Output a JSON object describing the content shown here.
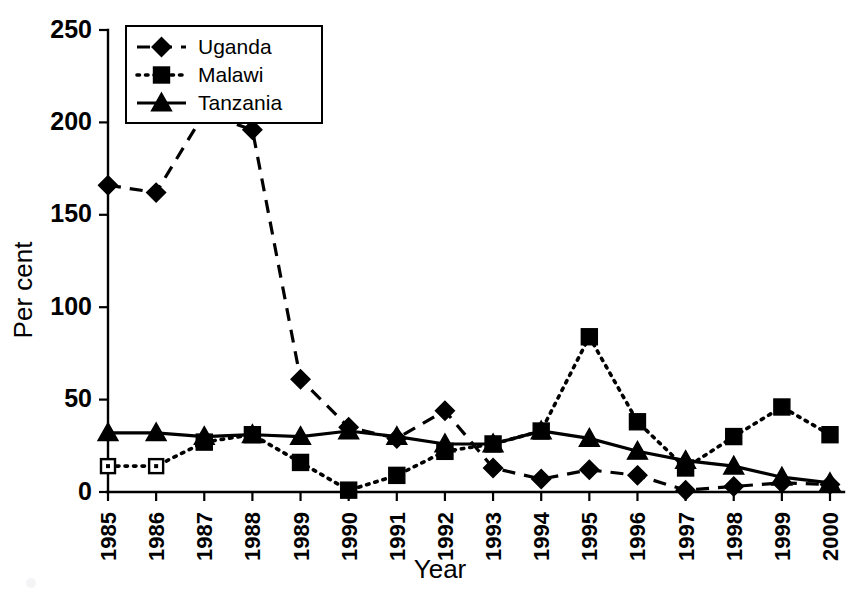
{
  "chart_data": {
    "type": "line",
    "title": "",
    "subtitle": "",
    "xlabel": "Year",
    "ylabel": "Per cent",
    "categories": [
      "1985",
      "1986",
      "1987",
      "1988",
      "1989",
      "1990",
      "1991",
      "1992",
      "1993",
      "1994",
      "1995",
      "1996",
      "1997",
      "1998",
      "1999",
      "2000"
    ],
    "xlim": [
      1985,
      2000
    ],
    "ylim": [
      0,
      250
    ],
    "ytick_labels": [
      "0",
      "50",
      "100",
      "150",
      "200",
      "250"
    ],
    "ytick_values": [
      0,
      50,
      100,
      150,
      200,
      250
    ],
    "grid": false,
    "legend_position": "top-left",
    "series": [
      {
        "name": "Uganda",
        "marker": "diamond",
        "line_style": "dashed",
        "color": "#000000",
        "values": [
          166,
          162,
          205,
          196,
          61,
          35,
          29,
          44,
          13,
          7,
          12,
          9,
          1,
          3,
          5,
          4
        ]
      },
      {
        "name": "Malawi",
        "marker": "square",
        "line_style": "dotted",
        "color": "#000000",
        "values": [
          14,
          14,
          27,
          31,
          16,
          1,
          9,
          22,
          26,
          33,
          84,
          38,
          13,
          30,
          46,
          31
        ]
      },
      {
        "name": "Tanzania",
        "marker": "triangle",
        "line_style": "solid",
        "color": "#000000",
        "values": [
          32,
          32,
          30,
          31,
          30,
          33,
          30,
          26,
          26,
          33,
          29,
          22,
          17,
          14,
          8,
          5
        ]
      }
    ],
    "open_markers": {
      "Malawi": [
        "1985",
        "1986"
      ]
    }
  },
  "legend": {
    "items": [
      {
        "label": "Uganda"
      },
      {
        "label": "Malawi"
      },
      {
        "label": "Tanzania"
      }
    ]
  },
  "axes": {
    "x_title": "Year",
    "y_title": "Per cent"
  }
}
